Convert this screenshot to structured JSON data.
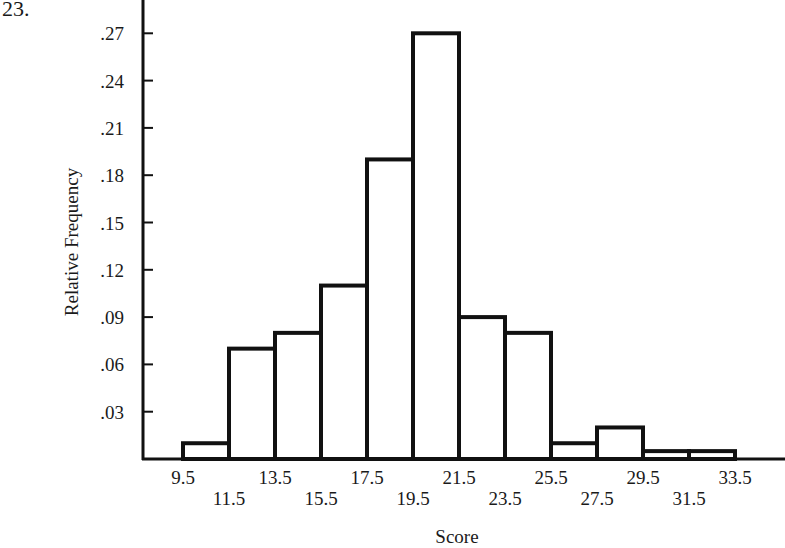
{
  "problem_number": "23.",
  "chart_data": {
    "type": "bar",
    "subtype": "histogram",
    "title": "",
    "xlabel": "Score",
    "ylabel": "Relative Frequency",
    "bin_edges": [
      9.5,
      11.5,
      13.5,
      15.5,
      17.5,
      19.5,
      21.5,
      23.5,
      25.5,
      27.5,
      29.5,
      31.5,
      33.5
    ],
    "categories": [
      "9.5-11.5",
      "11.5-13.5",
      "13.5-15.5",
      "15.5-17.5",
      "17.5-19.5",
      "19.5-21.5",
      "21.5-23.5",
      "23.5-25.5",
      "25.5-27.5",
      "27.5-29.5",
      "29.5-31.5",
      "31.5-33.5"
    ],
    "values": [
      0.01,
      0.07,
      0.08,
      0.11,
      0.19,
      0.27,
      0.09,
      0.08,
      0.01,
      0.02,
      0.005,
      0.005
    ],
    "x_tick_labels_row1": [
      "9.5",
      "13.5",
      "17.5",
      "21.5",
      "25.5",
      "29.5",
      "33.5"
    ],
    "x_tick_labels_row2": [
      "11.5",
      "15.5",
      "19.5",
      "23.5",
      "27.5",
      "31.5"
    ],
    "y_tick_labels": [
      ".03",
      ".06",
      ".09",
      ".12",
      ".15",
      ".18",
      ".21",
      ".24",
      ".27"
    ],
    "y_ticks": [
      0.03,
      0.06,
      0.09,
      0.12,
      0.15,
      0.18,
      0.21,
      0.24,
      0.27
    ],
    "ylim": [
      0,
      0.29
    ],
    "grid": false,
    "legend": null
  }
}
